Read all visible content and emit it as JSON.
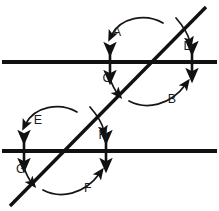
{
  "figure": {
    "background_color": "#ffffff",
    "line_color": "#111111",
    "label_color": "#1a1a1a"
  },
  "lines": {
    "upper_parallel": {
      "name": "upper-parallel-line",
      "y": 62,
      "x_start": 2,
      "x_end": 217
    },
    "lower_parallel": {
      "name": "lower-parallel-line",
      "y": 151,
      "x_start": 2,
      "x_end": 217
    },
    "transversal": {
      "name": "transversal-line",
      "x_start": 10,
      "y_start": 206,
      "x_end": 206,
      "y_end": 7
    }
  },
  "intersections": {
    "upper": {
      "x": 152,
      "y": 62
    },
    "lower": {
      "x": 66,
      "y": 151
    }
  },
  "tick_arrows": [
    {
      "name": "tick-arrow-upper-left",
      "x": 110,
      "y_top": 48,
      "y_bottom": 78
    },
    {
      "name": "tick-arrow-upper-right",
      "x": 192,
      "y_top": 47,
      "y_bottom": 76
    },
    {
      "name": "tick-arrow-lower-left",
      "x": 24,
      "y_top": 136,
      "y_bottom": 166
    },
    {
      "name": "tick-arrow-lower-right",
      "x": 106,
      "y_top": 136,
      "y_bottom": 166
    }
  ],
  "angle_labels": [
    {
      "id": "A",
      "text": "A",
      "x": 117,
      "y": 36,
      "region": "upper-intersection-upper-left"
    },
    {
      "id": "B",
      "text": "B",
      "x": 172,
      "y": 103,
      "region": "upper-intersection-lower-right"
    },
    {
      "id": "C",
      "text": "C",
      "x": 107,
      "y": 82,
      "region": "upper-intersection-lower-left"
    },
    {
      "id": "D",
      "text": "D",
      "x": 188,
      "y": 50,
      "region": "upper-intersection-upper-right"
    },
    {
      "id": "E",
      "text": "E",
      "x": 38,
      "y": 124,
      "region": "lower-intersection-upper-left"
    },
    {
      "id": "F",
      "text": "F",
      "x": 88,
      "y": 192,
      "region": "lower-intersection-lower-right"
    },
    {
      "id": "G",
      "text": "G",
      "x": 21,
      "y": 173,
      "region": "lower-intersection-lower-left"
    },
    {
      "id": "H",
      "text": "H",
      "x": 103,
      "y": 139,
      "region": "lower-intersection-upper-right"
    }
  ],
  "pointer_curves": [
    {
      "name": "pointer-curve-a",
      "label": "A"
    },
    {
      "name": "pointer-curve-b",
      "label": "B"
    },
    {
      "name": "pointer-curve-c",
      "label": "C"
    },
    {
      "name": "pointer-curve-d",
      "label": "D"
    },
    {
      "name": "pointer-curve-e",
      "label": "E"
    },
    {
      "name": "pointer-curve-f",
      "label": "F"
    },
    {
      "name": "pointer-curve-g",
      "label": "G"
    },
    {
      "name": "pointer-curve-h",
      "label": "H"
    }
  ]
}
